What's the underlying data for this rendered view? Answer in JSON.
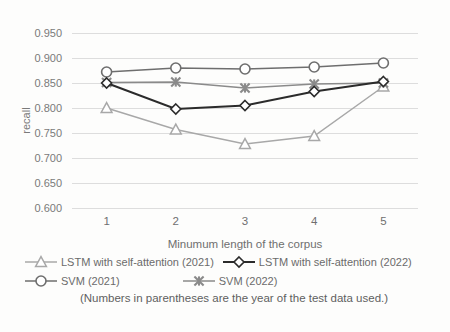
{
  "chart_data": {
    "type": "line",
    "title": "",
    "xlabel": "Minumum length of the corpus",
    "ylabel": "recall",
    "x": [
      1,
      2,
      3,
      4,
      5
    ],
    "categories": [
      "1",
      "2",
      "3",
      "4",
      "5"
    ],
    "xtick_labels": [
      "1",
      "2",
      "3",
      "4",
      "5"
    ],
    "ytick_labels": [
      "0.600",
      "0.650",
      "0.700",
      "0.750",
      "0.800",
      "0.850",
      "0.900",
      "0.950"
    ],
    "ytick_values": [
      0.6,
      0.65,
      0.7,
      0.75,
      0.8,
      0.85,
      0.9,
      0.95
    ],
    "ylim": [
      0.6,
      0.95
    ],
    "xlim": [
      0.5,
      5.5
    ],
    "grid": true,
    "grid_axis": "y",
    "legend_position": "bottom",
    "annotation": "(Numbers in parentheses are the year of the test data used.)",
    "series": [
      {
        "name": "LSTM with self-attention (2021)",
        "marker": "triangle",
        "color": "#a8a8a8",
        "values": [
          0.8,
          0.757,
          0.728,
          0.744,
          0.843
        ]
      },
      {
        "name": "LSTM with self-attention (2022)",
        "marker": "diamond",
        "color": "#2b2b2b",
        "values": [
          0.85,
          0.798,
          0.805,
          0.833,
          0.853
        ]
      },
      {
        "name": "SVM (2021)",
        "marker": "circle",
        "color": "#6e6e6e",
        "values": [
          0.872,
          0.88,
          0.878,
          0.882,
          0.89
        ]
      },
      {
        "name": "SVM (2022)",
        "marker": "x",
        "color": "#8a8a8a",
        "values": [
          0.851,
          0.852,
          0.84,
          0.848,
          0.85
        ]
      }
    ]
  },
  "legend": {
    "rows": [
      [
        {
          "label": "LSTM with self-attention (2021)",
          "series_index": 0
        },
        {
          "label": "LSTM with self-attention (2022)",
          "series_index": 1
        }
      ],
      [
        {
          "label": "SVM (2021)",
          "series_index": 2
        },
        {
          "label": "SVM (2022)",
          "series_index": 3
        }
      ]
    ]
  },
  "colors": {
    "background": "#fdfdfc",
    "gridline": "#dddddd",
    "axis_text": "#7a7a7a",
    "series_lstm_2021": "#a8a8a8",
    "series_lstm_2022": "#2b2b2b",
    "series_svm_2021": "#6e6e6e",
    "series_svm_2022": "#8a8a8a"
  }
}
